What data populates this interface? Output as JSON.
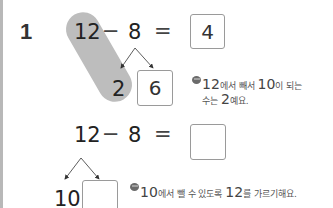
{
  "problem": {
    "number": "1",
    "example": {
      "minuend": "12",
      "operator": "−",
      "subtrahend": "8",
      "equals": "=",
      "answer": "4",
      "split_left": "2",
      "split_right": "6",
      "hint_line1_num": "12",
      "hint_line1_text": "에서 빼서 ",
      "hint_line1_num2": "10",
      "hint_line1_text2": "이 되는",
      "hint_line2_text": "수는 ",
      "hint_line2_num": "2",
      "hint_line2_text2": "예요."
    },
    "exercise": {
      "minuend": "12",
      "operator": "−",
      "subtrahend": "8",
      "equals": "=",
      "answer": "",
      "split_left": "10",
      "split_right": "",
      "hint_num": "10",
      "hint_text": "에서 뺄 수 있도록 ",
      "hint_num2": "12",
      "hint_text2": "를 가르기해요."
    }
  },
  "colors": {
    "highlight": "#bdbdbd",
    "box_border": "#9a9a9a",
    "left_bar": "#b8b8b8"
  }
}
